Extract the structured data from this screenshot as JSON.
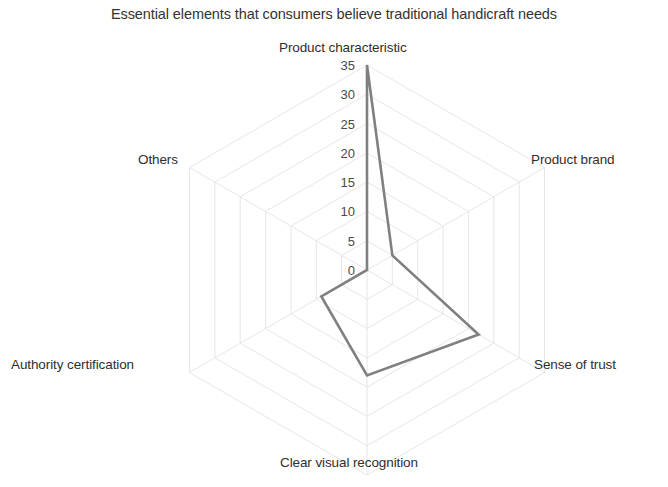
{
  "chart_data": {
    "type": "radar",
    "title": "Essential elements that consumers believe traditional handicraft needs",
    "categories": [
      "Product characteristic",
      "Product brand",
      "Sense of trust",
      "Clear visual recognition",
      "Authority certification",
      "Others"
    ],
    "values": [
      35,
      5,
      22,
      18,
      9,
      0
    ],
    "series": [
      {
        "name": "Essential elements",
        "values": [
          35,
          5,
          22,
          18,
          9,
          0
        ]
      }
    ],
    "tick_labels": [
      "0",
      "5",
      "10",
      "15",
      "20",
      "25",
      "30",
      "35"
    ],
    "rlim": [
      0,
      35
    ],
    "rstep": 5,
    "grid": true,
    "legend": "none",
    "xlabel": "",
    "ylabel": "",
    "series_color": "#808080",
    "grid_color": "#e3e3e3",
    "text_color": "#2e2e2e"
  },
  "labels": {
    "product_characteristic": "Product characteristic",
    "product_brand": "Product brand",
    "sense_of_trust": "Sense of trust",
    "clear_visual_recognition": "Clear visual recognition",
    "authority_certification": "Authority certification",
    "others": "Others"
  },
  "ticks": {
    "t0": "0",
    "t5": "5",
    "t10": "10",
    "t15": "15",
    "t20": "20",
    "t25": "25",
    "t30": "30",
    "t35": "35"
  }
}
